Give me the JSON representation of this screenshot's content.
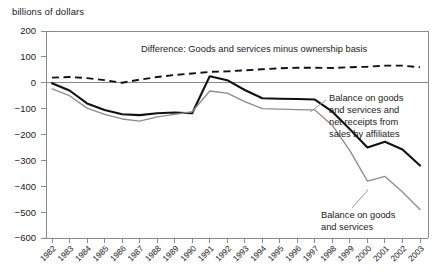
{
  "figure": {
    "unit_label": "billions of dollars"
  },
  "annotations": {
    "difference": "Difference: Goods and services minus ownership basis",
    "affiliates_line1": "Balance on goods",
    "affiliates_line2": "and services and",
    "affiliates_line3": "net receipts from",
    "affiliates_line4": "sales by affiliates",
    "goods_services_line1": "Balance on goods",
    "goods_services_line2": "and services"
  },
  "chart_data": {
    "type": "line",
    "title": "",
    "subtitle": "",
    "xlabel": "",
    "ylabel": "billions of dollars",
    "ylim": [
      -600,
      200
    ],
    "ytick_labels": [
      "200",
      "100",
      "0",
      "−100",
      "−200",
      "−300",
      "−400",
      "−500",
      "−600"
    ],
    "yticks": [
      200,
      100,
      0,
      -100,
      -200,
      -300,
      -400,
      -500,
      -600
    ],
    "grid": false,
    "zero_line": true,
    "legend_position": "inline-annotations",
    "categories": [
      "1982",
      "1983",
      "1984",
      "1985",
      "1986",
      "1987",
      "1988",
      "1989",
      "1990",
      "1991",
      "1992",
      "1993",
      "1994",
      "1995",
      "1996",
      "1997",
      "1998",
      "1999",
      "2000",
      "2001",
      "2002",
      "2003"
    ],
    "series": [
      {
        "name": "Difference: Goods and services minus ownership basis",
        "style": "dashed",
        "color": "#111111",
        "values": [
          20,
          22,
          18,
          10,
          0,
          12,
          22,
          30,
          36,
          42,
          44,
          48,
          52,
          56,
          58,
          58,
          57,
          60,
          62,
          66,
          66,
          60
        ]
      },
      {
        "name": "Balance on goods and services and net receipts from sales by affiliates",
        "style": "solid-thick",
        "color": "#111111",
        "values": [
          -2,
          -30,
          -80,
          -105,
          -122,
          -125,
          -118,
          -115,
          -118,
          25,
          10,
          -28,
          -60,
          -62,
          -63,
          -65,
          -112,
          -180,
          -250,
          -228,
          -258,
          -320
        ]
      },
      {
        "name": "Balance on goods and services",
        "style": "solid-thin",
        "color": "#8d8d8d",
        "values": [
          -24,
          -50,
          -98,
          -122,
          -140,
          -148,
          -132,
          -122,
          -112,
          -32,
          -40,
          -73,
          -100,
          -102,
          -104,
          -105,
          -165,
          -262,
          -380,
          -362,
          -422,
          -490
        ]
      }
    ]
  }
}
